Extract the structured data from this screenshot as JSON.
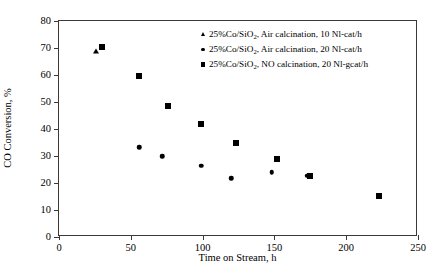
{
  "chart_data": {
    "type": "scatter",
    "title": "",
    "xlabel": "Time on Stream, h",
    "ylabel": "CO Conversion, %",
    "xlim": [
      0,
      250
    ],
    "ylim": [
      0,
      80
    ],
    "xticks": [
      0,
      50,
      100,
      150,
      200,
      250
    ],
    "yticks": [
      0,
      10,
      20,
      30,
      40,
      50,
      60,
      70,
      80
    ],
    "grid": false,
    "legend_position": "top-right-inside",
    "series": [
      {
        "name": "25%Co/SiO2, Air calcination, 10 Nl-cat/h",
        "label_html": "25%Co/SiO<sub>2</sub>, Air calcination, 10 Nl-cat/h",
        "marker": "triangle",
        "color": "#000000",
        "points": [
          {
            "x": 26,
            "y": 69.0
          }
        ]
      },
      {
        "name": "25%Co/SiO2, Air calcination, 20 Nl-cat/h",
        "label_html": "25%Co/SiO<sub>2</sub>, Air calcination, 20 Nl-cat/h",
        "marker": "circle",
        "color": "#000000",
        "points": [
          {
            "x": 56,
            "y": 33.3
          },
          {
            "x": 72,
            "y": 30.0
          },
          {
            "x": 99,
            "y": 26.4
          },
          {
            "x": 120,
            "y": 21.8
          },
          {
            "x": 148,
            "y": 24.0
          },
          {
            "x": 173,
            "y": 22.6
          }
        ]
      },
      {
        "name": "25%Co/SiO2, NO calcination, 20 Nl-gcat/h",
        "label_html": "25%Co/SiO<sub>2</sub>, NO calcination, 20 Nl-gcat/h",
        "marker": "square",
        "color": "#000000",
        "points": [
          {
            "x": 30,
            "y": 70.2
          },
          {
            "x": 56,
            "y": 59.5
          },
          {
            "x": 76,
            "y": 48.7
          },
          {
            "x": 99,
            "y": 42.0
          },
          {
            "x": 123,
            "y": 34.7
          },
          {
            "x": 152,
            "y": 28.8
          },
          {
            "x": 175,
            "y": 22.7
          },
          {
            "x": 223,
            "y": 15.3
          }
        ]
      }
    ]
  },
  "axis_color": "#3a3a3a"
}
